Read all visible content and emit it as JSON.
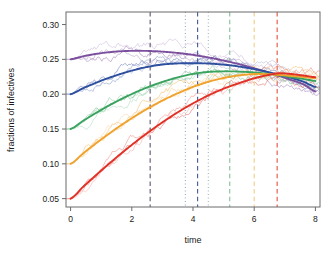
{
  "chart_data": {
    "type": "line",
    "title": "",
    "xlabel": "time",
    "ylabel": "fractions of infectives",
    "xlim": [
      -0.15,
      8.15
    ],
    "ylim": [
      0.038,
      0.318
    ],
    "xticks": [
      0,
      2,
      4,
      6,
      8
    ],
    "xtick_labels": [
      "0",
      "2",
      "4",
      "6",
      "8"
    ],
    "yticks": [
      0.05,
      0.1,
      0.15,
      0.2,
      0.25,
      0.3
    ],
    "ytick_labels": [
      "0.05",
      "0.10",
      "0.15",
      "0.20",
      "0.25",
      "0.30"
    ],
    "grid": false,
    "legend": "none",
    "frame": true,
    "x": [
      0,
      0.4,
      0.8,
      1.2,
      1.6,
      2.0,
      2.4,
      2.8,
      3.2,
      3.6,
      4.0,
      4.4,
      4.8,
      5.2,
      5.6,
      6.0,
      6.4,
      6.8,
      7.2,
      7.6,
      8.0
    ],
    "series": [
      {
        "name": "purple-mean",
        "color": "#7b4f9d",
        "initial_value": 0.25,
        "peak_time": 2.6,
        "peak_value": 0.262,
        "final_value": 0.204,
        "values": [
          0.25,
          0.2543,
          0.2576,
          0.26,
          0.2615,
          0.2622,
          0.2622,
          0.2616,
          0.2604,
          0.2587,
          0.2564,
          0.2536,
          0.2502,
          0.2463,
          0.242,
          0.2372,
          0.232,
          0.2264,
          0.2205,
          0.2143,
          0.204
        ]
      },
      {
        "name": "blue-mean",
        "color": "#2e4e9e",
        "initial_value": 0.2,
        "peak_time": 4.15,
        "peak_value": 0.2445,
        "final_value": 0.2105,
        "values": [
          0.2,
          0.2083,
          0.2158,
          0.2226,
          0.2286,
          0.2338,
          0.2382,
          0.2415,
          0.2434,
          0.2443,
          0.2445,
          0.2442,
          0.2432,
          0.2415,
          0.2391,
          0.236,
          0.2323,
          0.2281,
          0.2235,
          0.218,
          0.2105
        ]
      },
      {
        "name": "green-mean",
        "color": "#3aa35f",
        "initial_value": 0.15,
        "peak_time": 5.2,
        "peak_value": 0.2328,
        "final_value": 0.219,
        "values": [
          0.15,
          0.1614,
          0.1722,
          0.1824,
          0.1917,
          0.2002,
          0.2079,
          0.2146,
          0.2204,
          0.2253,
          0.2292,
          0.2315,
          0.2326,
          0.2328,
          0.2323,
          0.2312,
          0.2295,
          0.2272,
          0.2246,
          0.2219,
          0.219
        ]
      },
      {
        "name": "orange-mean",
        "color": "#f0a22e",
        "initial_value": 0.1,
        "peak_time": 6.0,
        "peak_value": 0.229,
        "final_value": 0.223,
        "values": [
          0.1,
          0.1145,
          0.1283,
          0.1415,
          0.1539,
          0.1655,
          0.1763,
          0.1862,
          0.1952,
          0.2033,
          0.2104,
          0.2164,
          0.2213,
          0.225,
          0.2275,
          0.229,
          0.2288,
          0.2278,
          0.2263,
          0.2247,
          0.223
        ]
      },
      {
        "name": "red-mean",
        "color": "#e03126",
        "initial_value": 0.05,
        "peak_time": 6.75,
        "peak_value": 0.23,
        "final_value": 0.2245,
        "values": [
          0.05,
          0.0665,
          0.0825,
          0.098,
          0.1129,
          0.1272,
          0.1407,
          0.1535,
          0.1655,
          0.1766,
          0.1868,
          0.196,
          0.2042,
          0.2112,
          0.2172,
          0.2228,
          0.227,
          0.23,
          0.229,
          0.2268,
          0.2245
        ]
      }
    ],
    "vertical_lines": [
      {
        "name": "purple-dashed",
        "x": 2.6,
        "color": "#6b5a78",
        "style": "dashed"
      },
      {
        "name": "blue-dotted",
        "x": 3.75,
        "color": "#8fa8cf",
        "style": "dotted"
      },
      {
        "name": "blue-dashed",
        "x": 4.15,
        "color": "#4a5f9e",
        "style": "dashed"
      },
      {
        "name": "green-dotted",
        "x": 4.5,
        "color": "#9fb8a8",
        "style": "dotted"
      },
      {
        "name": "green-dashed",
        "x": 5.2,
        "color": "#87c49c",
        "style": "dashed"
      },
      {
        "name": "orange-dashed",
        "x": 6.0,
        "color": "#f3cf8e",
        "style": "dashed"
      },
      {
        "name": "red-dashed",
        "x": 6.75,
        "color": "#e8574a",
        "style": "dashed"
      }
    ],
    "noise_traces": {
      "count_per_series": 3,
      "description": "thin jagged stochastic realizations around each smooth mean curve"
    }
  },
  "axes": {
    "x_axis_title": "time",
    "y_axis_title": "fractions of infectives"
  }
}
